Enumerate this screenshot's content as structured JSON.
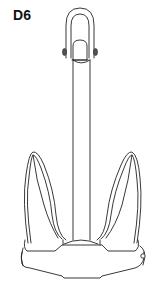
{
  "figure": {
    "label": "D6",
    "colors": {
      "background": "#ffffff",
      "stroke": "#222222",
      "label": "#111111"
    }
  }
}
